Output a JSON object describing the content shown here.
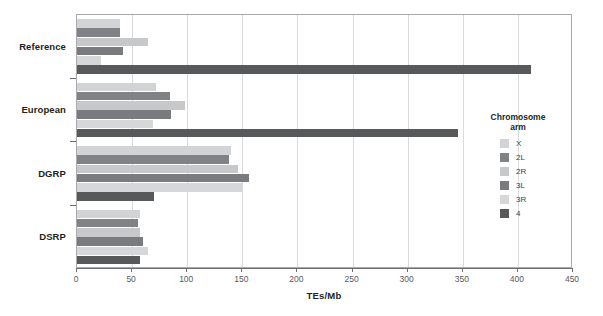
{
  "chart_data": {
    "type": "bar",
    "orientation": "horizontal",
    "title": "",
    "xlabel": "TEs/Mb",
    "ylabel": "",
    "xlim": [
      0,
      450
    ],
    "xticks": [
      0,
      50,
      100,
      150,
      200,
      250,
      300,
      350,
      400,
      450
    ],
    "xtick_labels": [
      "0",
      "50",
      "100",
      "150",
      "200",
      "250",
      "300",
      "350",
      "400",
      "450"
    ],
    "grid": "vertical",
    "categories": [
      "Reference",
      "European",
      "DGRP",
      "DSRP"
    ],
    "series": [
      {
        "name": "X",
        "color": "#d2d3d4",
        "values": [
          39,
          72,
          140,
          57
        ]
      },
      {
        "name": "2L",
        "color": "#808285",
        "values": [
          39,
          84,
          138,
          55
        ]
      },
      {
        "name": "2R",
        "color": "#c7c8ca",
        "values": [
          64,
          98,
          146,
          57
        ]
      },
      {
        "name": "3L",
        "color": "#797b7e",
        "values": [
          42,
          85,
          156,
          60
        ]
      },
      {
        "name": "3R",
        "color": "#d6d7d8",
        "values": [
          22,
          69,
          151,
          64
        ]
      },
      {
        "name": "4",
        "color": "#58595b",
        "values": [
          412,
          346,
          70,
          57
        ]
      }
    ],
    "legend": {
      "title_line1": "Chromosome",
      "title_line2": "arm",
      "position": "right",
      "entries": [
        {
          "label": "X",
          "color": "#d2d3d4"
        },
        {
          "label": "2L",
          "color": "#808285"
        },
        {
          "label": "2R",
          "color": "#c7c8ca"
        },
        {
          "label": "3L",
          "color": "#797b7e"
        },
        {
          "label": "3R",
          "color": "#d6d7d8"
        },
        {
          "label": "4",
          "color": "#58595b"
        }
      ]
    },
    "style": {
      "frame_color": "#a7a9ac",
      "grid_color": "#d9dadb",
      "axis_color": "#6d6e71",
      "text_color": "#231f20",
      "background": "#ffffff"
    }
  }
}
